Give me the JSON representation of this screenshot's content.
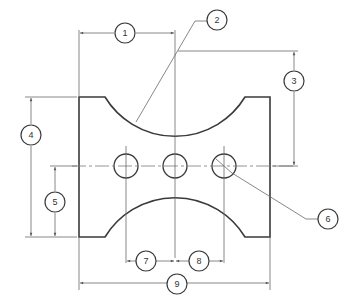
{
  "drawing": {
    "type": "engineering dimension drawing",
    "colors": {
      "outline": "#3a3a3a",
      "dimension": "#6a6a6a",
      "background": "#ffffff"
    },
    "callouts": [
      {
        "id": "1",
        "label": "1",
        "meaning": "horizontal distance from left edge to arc center"
      },
      {
        "id": "2",
        "label": "2",
        "meaning": "leader to top concave arc (radius)"
      },
      {
        "id": "3",
        "label": "3",
        "meaning": "vertical distance from arc center to hole centerline"
      },
      {
        "id": "4",
        "label": "4",
        "meaning": "overall height"
      },
      {
        "id": "5",
        "label": "5",
        "meaning": "hole centerline height from bottom"
      },
      {
        "id": "6",
        "label": "6",
        "meaning": "leader to hole diameter"
      },
      {
        "id": "7",
        "label": "7",
        "meaning": "spacing hole 1 to hole 2"
      },
      {
        "id": "8",
        "label": "8",
        "meaning": "spacing hole 2 to hole 3"
      },
      {
        "id": "9",
        "label": "9",
        "meaning": "overall width"
      }
    ],
    "holes": 3
  }
}
